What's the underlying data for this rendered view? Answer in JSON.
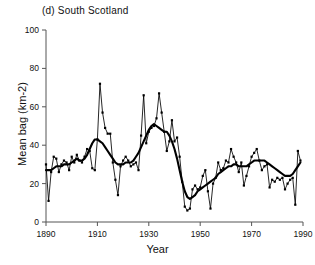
{
  "figure": {
    "panel_label": "(d) South Scotland",
    "xlabel": "Year",
    "ylabel": "Mean bag (km-2)",
    "line_color": "#000000",
    "background_color": "#ffffff",
    "axis_color": "#555555"
  },
  "chart_data": {
    "type": "line",
    "title": "(d) South Scotland",
    "xlabel": "Year",
    "ylabel": "Mean bag (km-2)",
    "xlim": [
      1890,
      1990
    ],
    "ylim": [
      0,
      100
    ],
    "xticks": [
      1890,
      1910,
      1930,
      1950,
      1970,
      1990
    ],
    "xtick_labels": [
      "1890",
      "1910",
      "1930",
      "1950",
      "1970",
      "1990"
    ],
    "yticks": [
      0,
      20,
      40,
      60,
      80,
      100
    ],
    "ytick_labels": [
      "0",
      "20",
      "40",
      "60",
      "80",
      "100"
    ],
    "grid": false,
    "legend": false,
    "markers": "filled-square",
    "x": [
      1890,
      1891,
      1892,
      1893,
      1894,
      1895,
      1896,
      1897,
      1898,
      1899,
      1900,
      1901,
      1902,
      1903,
      1904,
      1905,
      1906,
      1907,
      1908,
      1909,
      1910,
      1911,
      1912,
      1913,
      1914,
      1915,
      1916,
      1917,
      1918,
      1919,
      1920,
      1921,
      1922,
      1923,
      1924,
      1925,
      1926,
      1927,
      1928,
      1929,
      1930,
      1931,
      1932,
      1933,
      1934,
      1935,
      1936,
      1937,
      1938,
      1939,
      1940,
      1941,
      1942,
      1943,
      1944,
      1945,
      1946,
      1947,
      1948,
      1949,
      1950,
      1951,
      1952,
      1953,
      1954,
      1955,
      1956,
      1957,
      1958,
      1959,
      1960,
      1961,
      1962,
      1963,
      1964,
      1965,
      1966,
      1967,
      1968,
      1969,
      1970,
      1971,
      1972,
      1973,
      1974,
      1975,
      1976,
      1977,
      1978,
      1979,
      1980,
      1981,
      1982,
      1983,
      1984,
      1985,
      1986,
      1987,
      1988,
      1989
    ],
    "series": [
      {
        "name": "Annual mean bag",
        "style": "thin-line-with-markers",
        "values": [
          30,
          11,
          26,
          34,
          33,
          26,
          30,
          32,
          31,
          27,
          34,
          31,
          35,
          32,
          31,
          34,
          38,
          37,
          28,
          27,
          43,
          72,
          57,
          49,
          46,
          46,
          31,
          22,
          14,
          29,
          32,
          34,
          32,
          29,
          30,
          31,
          27,
          45,
          66,
          41,
          47,
          49,
          50,
          54,
          67,
          57,
          47,
          37,
          42,
          53,
          42,
          44,
          34,
          21,
          8,
          6,
          7,
          17,
          19,
          17,
          18,
          24,
          27,
          16,
          7,
          20,
          23,
          31,
          27,
          28,
          32,
          31,
          38,
          34,
          31,
          26,
          31,
          19,
          24,
          29,
          34,
          36,
          38,
          32,
          27,
          29,
          30,
          18,
          22,
          21,
          23,
          22,
          23,
          17,
          20,
          22,
          23,
          9,
          37,
          32
        ]
      },
      {
        "name": "Smoothed trend",
        "style": "thick-line",
        "values": [
          27,
          27,
          27,
          28,
          29,
          29,
          29,
          30,
          30,
          30,
          31,
          32,
          33,
          32,
          32,
          33,
          35,
          38,
          41,
          43,
          43,
          42,
          41,
          39,
          37,
          35,
          33,
          31,
          30,
          30,
          30,
          31,
          31,
          31,
          32,
          34,
          36,
          39,
          42,
          45,
          48,
          50,
          51,
          50,
          49,
          48,
          47,
          47,
          45,
          42,
          38,
          33,
          27,
          21,
          16,
          13,
          12,
          13,
          14,
          16,
          17,
          18,
          19,
          20,
          21,
          22,
          23,
          25,
          26,
          27,
          28,
          29,
          29,
          30,
          30,
          29,
          29,
          29,
          29,
          30,
          31,
          32,
          32,
          32,
          32,
          32,
          31,
          30,
          29,
          28,
          27,
          26,
          25,
          24,
          24,
          24,
          25,
          27,
          29,
          31
        ]
      }
    ]
  }
}
